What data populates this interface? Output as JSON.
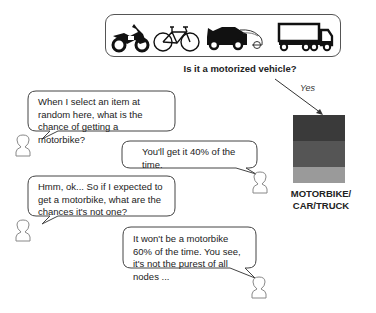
{
  "header": {
    "vehicles": [
      {
        "name": "motorbike",
        "icon": "motorbike-icon"
      },
      {
        "name": "bicycle",
        "icon": "bicycle-icon"
      },
      {
        "name": "car",
        "icon": "car-icon"
      },
      {
        "name": "truck",
        "icon": "truck-icon"
      }
    ],
    "question": "Is it a motorized vehicle?"
  },
  "branch": {
    "label": "Yes"
  },
  "node": {
    "label_line1": "MOTORBIKE/",
    "label_line2": "CAR/TRUCK",
    "bands": [
      {
        "class": "motorbike",
        "color": "#3a3a3a"
      },
      {
        "class": "car",
        "color": "#555555"
      },
      {
        "class": "truck",
        "color": "#9a9a9a"
      }
    ]
  },
  "dialogue": [
    {
      "speaker": "left",
      "text": "When I select an item at random here, what is the chance of getting a motorbike?"
    },
    {
      "speaker": "right",
      "text": "You'll get it 40% of the time."
    },
    {
      "speaker": "left",
      "text": "Hmm, ok... So if I expected to get a motorbike, what are the chances it's not one?"
    },
    {
      "speaker": "right",
      "text": "It won't be a motorbike 60% of the time. You see, it's not the purest of all nodes ..."
    }
  ]
}
